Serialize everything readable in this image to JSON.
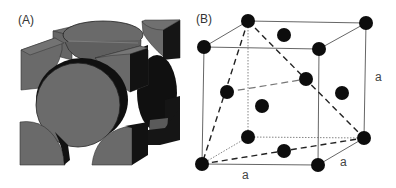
{
  "figure": {
    "panels": [
      {
        "id": "A",
        "label": "(A)",
        "description": "Space-filling model of face-centered cubic unit cell showing cut atom sections"
      },
      {
        "id": "B",
        "label": "(B)",
        "description": "Ball-and-stick model of face-centered cubic lattice with lattice parameter a"
      }
    ],
    "dimension_labels": {
      "height": "a",
      "depth": "a",
      "width": "a"
    },
    "colors": {
      "atom_face": "#6b6b6b",
      "atom_shadow": "#111111",
      "atom_ball": "#0d0d0d",
      "edge": "#555555"
    }
  }
}
